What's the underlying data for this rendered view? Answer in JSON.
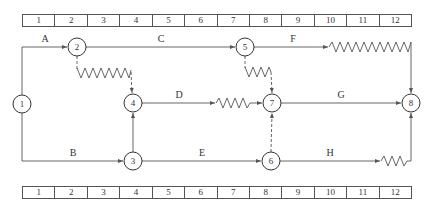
{
  "timeline": {
    "units": [
      "1",
      "2",
      "3",
      "4",
      "5",
      "6",
      "7",
      "8",
      "9",
      "10",
      "11",
      "12"
    ]
  },
  "nodes": [
    {
      "id": "1",
      "x": 22,
      "y": 104
    },
    {
      "id": "2",
      "x": 77,
      "y": 47
    },
    {
      "id": "3",
      "x": 133,
      "y": 161
    },
    {
      "id": "4",
      "x": 133,
      "y": 103
    },
    {
      "id": "5",
      "x": 245,
      "y": 47
    },
    {
      "id": "6",
      "x": 271,
      "y": 161
    },
    {
      "id": "7",
      "x": 272,
      "y": 103
    },
    {
      "id": "8",
      "x": 411,
      "y": 103
    }
  ],
  "activities": [
    {
      "label": "A",
      "from": "1",
      "to": "2"
    },
    {
      "label": "B",
      "from": "1",
      "to": "3"
    },
    {
      "label": "C",
      "from": "2",
      "to": "5"
    },
    {
      "label": "D",
      "from": "4",
      "to": "7",
      "float": true
    },
    {
      "label": "E",
      "from": "3",
      "to": "6"
    },
    {
      "label": "F",
      "from": "5",
      "to": "8",
      "float": true
    },
    {
      "label": "G",
      "from": "7",
      "to": "8"
    },
    {
      "label": "H",
      "from": "6",
      "to": "8",
      "float": true
    }
  ],
  "dummies": [
    {
      "from": "2",
      "to": "4",
      "float": true
    },
    {
      "from": "3",
      "to": "4"
    },
    {
      "from": "5",
      "to": "7",
      "float": true
    },
    {
      "from": "6",
      "to": "7"
    }
  ],
  "colors": {
    "line": "#555555",
    "text": "#333333"
  }
}
